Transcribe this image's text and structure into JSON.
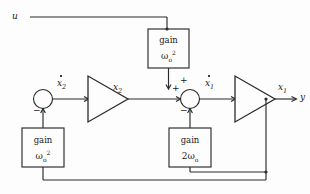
{
  "diagram": {
    "type": "control-block-diagram",
    "background_color": "#fdfdfd",
    "line_color": "#2b2b2b",
    "signals": {
      "input": "u",
      "output": "y",
      "x1": "x",
      "x1_sub": "1",
      "x2": "x",
      "x2_sub": "2",
      "x1dot": "x",
      "x1dot_sub": "1",
      "x2dot": "x",
      "x2dot_sub": "2"
    },
    "blocks": [
      {
        "id": "gain-omega-sq-top",
        "word": "gain",
        "symbol": "ω",
        "sub": "o",
        "sup": "2",
        "coef": ""
      },
      {
        "id": "gain-omega-sq-left",
        "word": "gain",
        "symbol": "ω",
        "sub": "o",
        "sup": "2",
        "coef": ""
      },
      {
        "id": "gain-two-omega",
        "word": "gain",
        "symbol": "ω",
        "sub": "o",
        "sup": "",
        "coef": "2"
      }
    ],
    "summers": [
      {
        "id": "summer-left",
        "signs": [
          "−"
        ]
      },
      {
        "id": "summer-center",
        "signs": [
          "+",
          "+",
          "−"
        ]
      }
    ],
    "integrators": [
      {
        "id": "integrator-x2",
        "label": ""
      },
      {
        "id": "integrator-x1",
        "label": ""
      }
    ],
    "sign_plus": "+",
    "sign_minus": "−"
  }
}
